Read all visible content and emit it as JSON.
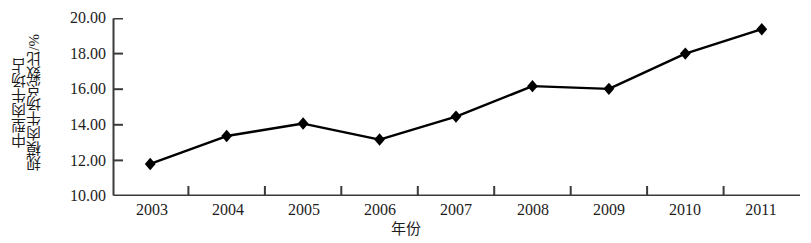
{
  "chart_data": {
    "type": "line",
    "title": "",
    "subtitle": "",
    "xlabel": "年份",
    "ylabel": "中型肉牛场占规模肉牛场总数比/%",
    "ylabel_lines": [
      "中型肉牛场占",
      "规模肉牛场总数比/%"
    ],
    "categories": [
      "2003",
      "2004",
      "2005",
      "2006",
      "2007",
      "2008",
      "2009",
      "2010",
      "2011"
    ],
    "x": [
      2003,
      2004,
      2005,
      2006,
      2007,
      2008,
      2009,
      2010,
      2011
    ],
    "values": [
      11.8,
      13.37,
      14.07,
      13.17,
      14.46,
      16.17,
      16.02,
      18.0,
      19.37
    ],
    "series": [
      {
        "name": "中型肉牛场占规模肉牛场总数比",
        "values": [
          11.8,
          13.37,
          14.07,
          13.17,
          14.46,
          16.17,
          16.02,
          18.0,
          19.37
        ],
        "color": "#000000",
        "marker": "diamond",
        "line_style": "solid"
      }
    ],
    "ylim": [
      10.0,
      20.0
    ],
    "ytick_values": [
      20.0,
      18.0,
      16.0,
      14.0,
      12.0,
      10.0
    ],
    "ytick_labels": [
      "20.00",
      "18.00",
      "16.00",
      "14.00",
      "12.00",
      "10.00"
    ],
    "xtick_labels": [
      "2003",
      "2004",
      "2005",
      "2006",
      "2007",
      "2008",
      "2009",
      "2010",
      "2011"
    ],
    "grid": false,
    "legend": false,
    "legend_position": "none",
    "annotations": []
  },
  "style": {
    "line_color": "#000000",
    "marker_color": "#000000",
    "axis_color": "#3a3a3a",
    "text_color": "#1d1d1d",
    "background": "#ffffff"
  }
}
